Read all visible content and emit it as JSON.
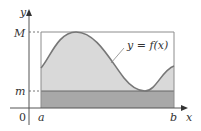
{
  "figure": {
    "axes": {
      "x_label": "x",
      "y_label": "y",
      "origin_label": "0"
    },
    "interval": {
      "left_label": "a",
      "right_label": "b"
    },
    "levels": {
      "max_label": "M",
      "min_label": "m"
    },
    "curve": {
      "label": "y = f(x)"
    },
    "colors": {
      "area_under_curve": "#d9d9d9",
      "min_rectangle": "#a8a8a8",
      "curve": "#777777",
      "box": "#8c8c8c",
      "axis": "#555555"
    }
  }
}
